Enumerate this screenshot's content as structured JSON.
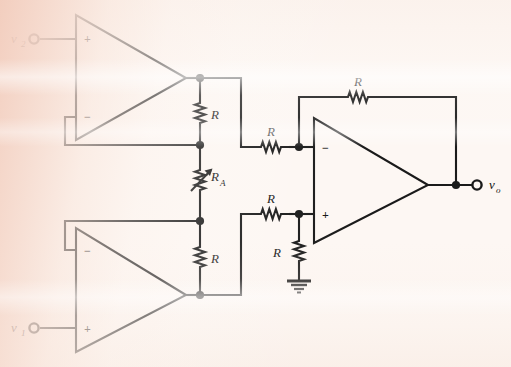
{
  "figure": {
    "kind": "circuit-schematic",
    "line_color": "#1a1a1a",
    "paper_color": "#fdf7f3",
    "tint_color": "#f2ccbc"
  },
  "inputs": [
    {
      "id": "v2",
      "label": "v",
      "subscript": "2",
      "terminal": "open-circle",
      "goes_to": "top-opamp-noninverting"
    },
    {
      "id": "v1",
      "label": "v",
      "subscript": "1",
      "terminal": "open-circle",
      "goes_to": "bottom-opamp-noninverting"
    }
  ],
  "output": {
    "id": "vo",
    "label": "v",
    "subscript": "o",
    "terminal": "open-circle",
    "from": "right-opamp-output"
  },
  "opamps": [
    {
      "id": "top-opamp",
      "top_terminal": "+",
      "bottom_terminal": "−",
      "input_signal": "v2"
    },
    {
      "id": "bottom-opamp",
      "top_terminal": "−",
      "bottom_terminal": "+",
      "input_signal": "v1"
    },
    {
      "id": "right-opamp",
      "top_terminal": "−",
      "bottom_terminal": "+",
      "input_signal": "difference"
    }
  ],
  "resistors": [
    {
      "id": "r-top-bridge",
      "label": "R",
      "orientation": "vertical",
      "type": "fixed",
      "position": "between top op-amp output node and R_A upper node"
    },
    {
      "id": "r-gain",
      "label": "R",
      "subscript": "A",
      "orientation": "vertical",
      "type": "variable",
      "position": "gain-setting potentiometer between the two bridge resistors"
    },
    {
      "id": "r-bottom-bridge",
      "label": "R",
      "orientation": "vertical",
      "type": "fixed",
      "position": "between R_A lower node and bottom op-amp output node"
    },
    {
      "id": "r-inverting-input",
      "label": "R",
      "orientation": "horizontal",
      "type": "fixed",
      "position": "series into right op-amp inverting input"
    },
    {
      "id": "r-noninverting-input",
      "label": "R",
      "orientation": "horizontal",
      "type": "fixed",
      "position": "series into right op-amp non-inverting input"
    },
    {
      "id": "r-to-ground",
      "label": "R",
      "orientation": "vertical",
      "type": "fixed",
      "position": "from right op-amp non-inverting node to ground"
    },
    {
      "id": "r-feedback",
      "label": "R",
      "orientation": "horizontal",
      "type": "fixed",
      "position": "feedback from right op-amp output to inverting input"
    }
  ],
  "ground": {
    "id": "ground-symbol",
    "type": "earth-ground",
    "attached_to": "r-to-ground"
  },
  "junction_dots": 10
}
